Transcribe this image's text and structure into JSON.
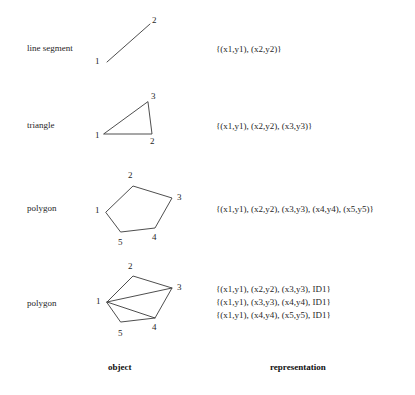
{
  "figure": {
    "columns": {
      "object_header": "object",
      "representation_header": "representation"
    },
    "stroke_color": "#3a3a3a",
    "text_color": "#1f1f1f",
    "background_color": "#ffffff",
    "rows": [
      {
        "name": "line-segment",
        "label": "line segment",
        "representation": [
          "{(x1,y1), (x2,y2)}"
        ],
        "vertex_labels": [
          "1",
          "2"
        ]
      },
      {
        "name": "triangle",
        "label": "triangle",
        "representation": [
          "{(x1,y1), (x2,y2), (x3,y3)}"
        ],
        "vertex_labels": [
          "1",
          "2",
          "3"
        ]
      },
      {
        "name": "polygon",
        "label": "polygon",
        "representation": [
          "{(x1,y1), (x2,y2), (x3,y3), (x4,y4), (x5,y5)}"
        ],
        "vertex_labels": [
          "1",
          "2",
          "3",
          "4",
          "5"
        ]
      },
      {
        "name": "polygon-triangulated",
        "label": "polygon",
        "representation": [
          "{(x1,y1), (x2,y2), (x3,y3), ID1}",
          "{(x1,y1), (x3,y3), (x4,y4), ID1}",
          "{(x1,y1), (x4,y4), (x5,y5), ID1}"
        ],
        "vertex_labels": [
          "1",
          "2",
          "3",
          "4",
          "5"
        ]
      }
    ]
  }
}
